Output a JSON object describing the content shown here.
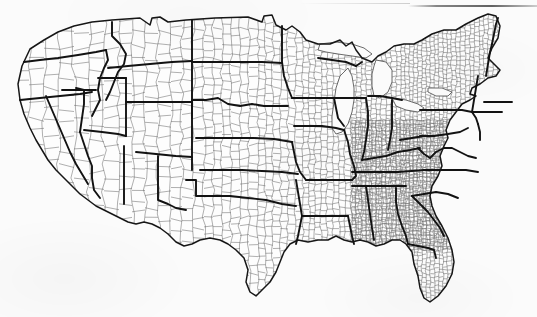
{
  "document": {
    "type": "scanned-map",
    "subject": "Contiguous United States county and state boundary map",
    "caption": "",
    "background_color": "#fbfbfb",
    "county_line_color": "#6e6e6e",
    "state_line_color": "#121212",
    "has_labels": false,
    "has_legend": false,
    "has_title": false,
    "scan_artifact": "dark horizontal streak along upper right edge"
  },
  "map": {
    "projection": "albers-usa-like",
    "regions": [
      {
        "name": "Pacific Northwest",
        "states": [
          "Washington",
          "Oregon",
          "Idaho"
        ]
      },
      {
        "name": "Mountain West",
        "states": [
          "Montana",
          "Wyoming",
          "Nevada",
          "Utah",
          "Colorado"
        ]
      },
      {
        "name": "Southwest",
        "states": [
          "California",
          "Arizona",
          "New Mexico",
          "Texas",
          "Oklahoma"
        ]
      },
      {
        "name": "Great Plains",
        "states": [
          "North Dakota",
          "South Dakota",
          "Nebraska",
          "Kansas"
        ]
      },
      {
        "name": "Upper Midwest",
        "states": [
          "Minnesota",
          "Iowa",
          "Wisconsin",
          "Michigan",
          "Illinois",
          "Indiana",
          "Ohio",
          "Missouri"
        ]
      },
      {
        "name": "Southeast",
        "states": [
          "Arkansas",
          "Louisiana",
          "Mississippi",
          "Alabama",
          "Georgia",
          "Florida",
          "Tennessee",
          "Kentucky",
          "South Carolina",
          "North Carolina",
          "Virginia",
          "West Virginia"
        ]
      },
      {
        "name": "Northeast",
        "states": [
          "Maine",
          "New Hampshire",
          "Vermont",
          "Massachusetts",
          "Rhode Island",
          "Connecticut",
          "New York",
          "New Jersey",
          "Pennsylvania",
          "Delaware",
          "Maryland"
        ]
      }
    ],
    "water_features": [
      "Lake Michigan",
      "Lake Superior",
      "Lake Huron",
      "Lake Erie",
      "Lake Ontario",
      "Chesapeake Bay",
      "Gulf of Mexico",
      "Atlantic Ocean",
      "Pacific Ocean"
    ],
    "boundary_types": [
      {
        "id": "county",
        "label": "County boundary",
        "weight": "thin",
        "color": "#6e6e6e"
      },
      {
        "id": "state",
        "label": "State boundary",
        "weight": "thick",
        "color": "#121212"
      },
      {
        "id": "national",
        "label": "National boundary / coastline",
        "weight": "medium",
        "color": "#161616"
      }
    ]
  }
}
